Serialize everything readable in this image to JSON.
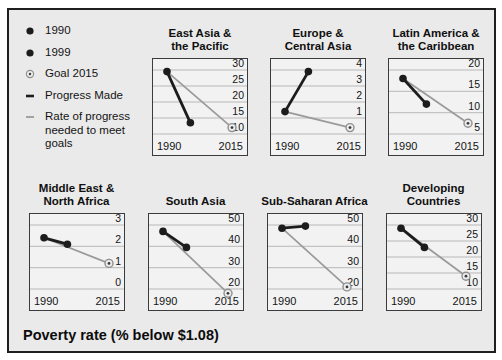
{
  "legend": {
    "items": [
      {
        "label": "1990",
        "marker": "dot"
      },
      {
        "label": "1999",
        "marker": "dot"
      },
      {
        "label": "Goal 2015",
        "marker": "goal"
      },
      {
        "label": "Progress Made",
        "marker": "dash-black"
      },
      {
        "label": "Rate of progress\nneeded to meet goals",
        "marker": "dash-gray"
      }
    ]
  },
  "caption": {
    "title": "Poverty rate (% below $1.08)",
    "source": "Source:  www.developmentgoals.org/Poverty.htm (World Bank Site)"
  },
  "lines_meaning": {
    "black_line": "Progress Made (1990 to 1999)",
    "gray_line": "Rate of progress needed to meet goals (1990 to Goal 2015)"
  },
  "colors": {
    "figure_bg": "#eaeaea",
    "plot_bg": "#f2f2f2",
    "plot_border": "#3c3c3c",
    "gridline": "#b8b8b8",
    "series_black": "#1c1c1c",
    "goal_line": "#9a9a9a",
    "goal_ring": "#8f8f8f",
    "goal_fill": "#ededed",
    "goal_center": "#3a3a3a"
  },
  "chart_data": [
    {
      "type": "line",
      "title": "East Asia &\nthe Pacific",
      "xlabels": [
        "1990",
        "2015"
      ],
      "x_years": [
        1990,
        1999,
        2015
      ],
      "yticks": [
        {
          "v": 30,
          "label": "30"
        },
        {
          "v": 25,
          "label": "25"
        },
        {
          "v": 20,
          "label": "20"
        },
        {
          "v": 15,
          "label": "15"
        },
        {
          "v": 10,
          "label": "10"
        }
      ],
      "values": {
        "y1990": 29.5,
        "y1999": 13.5,
        "goal2015": 12
      }
    },
    {
      "type": "line",
      "title": "Europe &\nCentral Asia",
      "xlabels": [
        "1990",
        "2015"
      ],
      "x_years": [
        1990,
        1999,
        2015
      ],
      "yticks": [
        {
          "v": 4,
          "label": "4"
        },
        {
          "v": 3,
          "label": "3"
        },
        {
          "v": 2,
          "label": "2"
        },
        {
          "v": 1,
          "label": "1"
        },
        {
          "v": 0,
          "label": ""
        }
      ],
      "values": {
        "y1990": 1.4,
        "y1999": 3.9,
        "goal2015": 0.4
      }
    },
    {
      "type": "line",
      "title": "Latin America &\nthe Caribbean",
      "xlabels": [
        "1990",
        "2015"
      ],
      "x_years": [
        1990,
        1999,
        2015
      ],
      "yticks": [
        {
          "v": 20,
          "label": "20"
        },
        {
          "v": 15,
          "label": "15"
        },
        {
          "v": 10,
          "label": "10"
        },
        {
          "v": 5,
          "label": "5"
        }
      ],
      "values": {
        "y1990": 18,
        "y1999": 12,
        "goal2015": 7.5
      }
    },
    {
      "type": "line",
      "title": "Middle East &\nNorth Africa",
      "xlabels": [
        "1990",
        "2015"
      ],
      "x_years": [
        1990,
        1999,
        2015
      ],
      "yticks": [
        {
          "v": 3,
          "label": "3"
        },
        {
          "v": 2,
          "label": "2"
        },
        {
          "v": 1,
          "label": "1"
        },
        {
          "v": 0,
          "label": "0"
        }
      ],
      "values": {
        "y1990": 2.4,
        "y1999": 2.1,
        "goal2015": 1.2
      }
    },
    {
      "type": "line",
      "title": "South Asia",
      "xlabels": [
        "1990",
        "2015"
      ],
      "x_years": [
        1990,
        1999,
        2015
      ],
      "yticks": [
        {
          "v": 50,
          "label": "50"
        },
        {
          "v": 40,
          "label": "40"
        },
        {
          "v": 30,
          "label": "30"
        },
        {
          "v": 20,
          "label": "20"
        }
      ],
      "values": {
        "y1990": 47,
        "y1999": 39.5,
        "goal2015": 18
      }
    },
    {
      "type": "line",
      "title": "Sub-Saharan Africa",
      "xlabels": [
        "1990",
        "2015"
      ],
      "x_years": [
        1990,
        1999,
        2015
      ],
      "yticks": [
        {
          "v": 50,
          "label": "50"
        },
        {
          "v": 40,
          "label": "40"
        },
        {
          "v": 30,
          "label": "30"
        },
        {
          "v": 20,
          "label": "20"
        }
      ],
      "values": {
        "y1990": 48.5,
        "y1999": 49.5,
        "goal2015": 21
      }
    },
    {
      "type": "line",
      "title": "Developing\nCountries",
      "xlabels": [
        "1990",
        "2015"
      ],
      "x_years": [
        1990,
        1999,
        2015
      ],
      "yticks": [
        {
          "v": 30,
          "label": "30"
        },
        {
          "v": 25,
          "label": "25"
        },
        {
          "v": 20,
          "label": "20"
        },
        {
          "v": 15,
          "label": "15"
        },
        {
          "v": 10,
          "label": "10"
        }
      ],
      "values": {
        "y1990": 29,
        "y1999": 23,
        "goal2015": 14
      }
    }
  ]
}
